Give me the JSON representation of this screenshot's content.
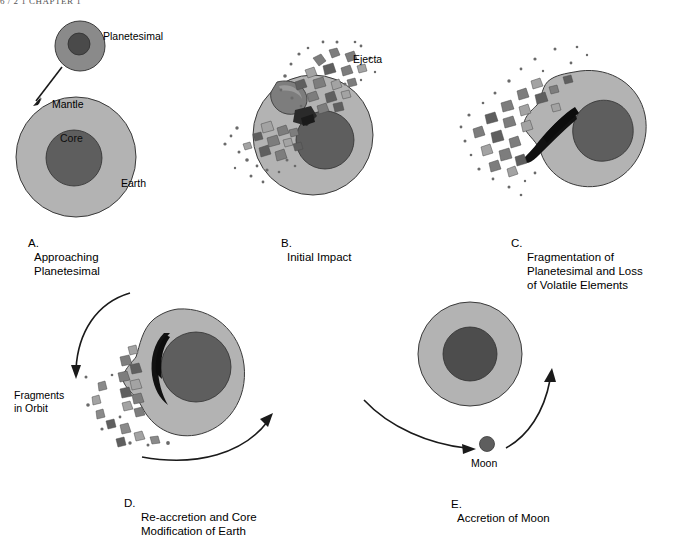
{
  "header": {
    "running_head": "6 / 2   1    CHAPTER 1"
  },
  "figure": {
    "type": "process-diagram",
    "panel_count": 5
  },
  "colors": {
    "mantle": "#b3b3b3",
    "core": "#5e5e5e",
    "planetesimal_mantle": "#8a8a8a",
    "planetesimal_core": "#4a4a4a",
    "debris_light": "#a3a3a3",
    "debris_mid": "#7d7d7d",
    "debris_dark": "#4f4f4f",
    "streak": "#111111",
    "outline": "#3a3a3a",
    "arrow": "#1a1a1a",
    "text": "#000000",
    "background": "#ffffff"
  },
  "panels": [
    {
      "id": "A",
      "letter": "A.",
      "caption": "Approaching\nPlanetesimal",
      "labels": [
        {
          "name": "planetesimal",
          "text": "Planetesimal"
        },
        {
          "name": "mantle",
          "text": "Mantle"
        },
        {
          "name": "core",
          "text": "Core"
        },
        {
          "name": "earth",
          "text": "Earth"
        }
      ],
      "bodies": [
        {
          "name": "planetesimal",
          "shape": "circle",
          "layers": [
            "mantle",
            "core"
          ]
        },
        {
          "name": "earth",
          "shape": "circle",
          "layers": [
            "mantle",
            "core"
          ]
        }
      ],
      "arrows": [
        {
          "name": "impact-trajectory-arrow",
          "direction": "down-left",
          "style": "straight"
        }
      ]
    },
    {
      "id": "B",
      "letter": "B.",
      "caption": "Initial Impact",
      "labels": [
        {
          "name": "ejecta",
          "text": "Ejecta"
        }
      ],
      "bodies": [
        {
          "name": "earth",
          "shape": "circle",
          "layers": [
            "mantle",
            "core"
          ]
        },
        {
          "name": "planetesimal-remnant",
          "shape": "crescent",
          "layers": [
            "mantle"
          ]
        }
      ],
      "arrows": [],
      "debris_count": 95
    },
    {
      "id": "C",
      "letter": "C.",
      "caption": "Fragmentation of\nPlanetesimal and Loss\nof Volatile Elements",
      "labels": [],
      "bodies": [
        {
          "name": "earth-deformed",
          "shape": "irregular-blob",
          "layers": [
            "mantle",
            "core"
          ]
        },
        {
          "name": "planetesimal-core-streak",
          "shape": "streak",
          "layers": [
            "core"
          ]
        }
      ],
      "arrows": [],
      "debris_count": 85
    },
    {
      "id": "D",
      "letter": "D.",
      "caption": "Re-accretion and Core\nModification of Earth",
      "labels": [
        {
          "name": "fragments-in-orbit",
          "text": "Fragments\nin Orbit"
        }
      ],
      "bodies": [
        {
          "name": "earth-deformed",
          "shape": "irregular-blob",
          "layers": [
            "mantle",
            "core"
          ]
        },
        {
          "name": "sinking-core-streak",
          "shape": "streak",
          "layers": [
            "core"
          ]
        }
      ],
      "arrows": [
        {
          "name": "orbit-inflow-arrow",
          "direction": "down",
          "style": "curved"
        },
        {
          "name": "orbit-outflow-arrow",
          "direction": "right-up",
          "style": "curved"
        }
      ],
      "debris_count": 40
    },
    {
      "id": "E",
      "letter": "E.",
      "caption": "Accretion of Moon",
      "labels": [
        {
          "name": "moon",
          "text": "Moon"
        }
      ],
      "bodies": [
        {
          "name": "earth",
          "shape": "circle",
          "layers": [
            "mantle",
            "core"
          ]
        },
        {
          "name": "moon",
          "shape": "circle",
          "layers": [
            "core"
          ]
        }
      ],
      "arrows": [
        {
          "name": "moon-inflow-arrow",
          "direction": "right",
          "style": "curved"
        },
        {
          "name": "moon-orbit-arrow",
          "direction": "up-right",
          "style": "curved"
        }
      ]
    }
  ]
}
